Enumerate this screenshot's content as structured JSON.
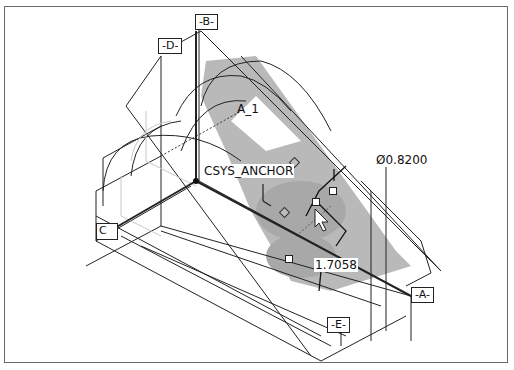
{
  "viewport": {
    "description": "3D CAD model viewport (isometric part with datum planes)"
  },
  "datums": {
    "B": "-B-",
    "D": "-D-",
    "C": "C",
    "A": "-A-",
    "E": "-E-"
  },
  "annotations": {
    "axis": "A_1",
    "csys": "CSYS_ANCHOR",
    "diameter_symbol": "Ø",
    "diameter_value": "0.8200",
    "dimension": "1.7058"
  },
  "colors": {
    "highlight": "#b4b4b4",
    "line": "#222222",
    "frame": "#6a6a6a"
  }
}
